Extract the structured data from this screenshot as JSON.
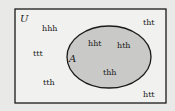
{
  "diagram": {
    "type": "venn",
    "universe_label": "U",
    "set_label": "A",
    "colors": {
      "background": "#e9e9e7",
      "universe_fill": "#f1f1ef",
      "set_fill": "#c9c9c7",
      "stroke": "#1a1a1a"
    },
    "outside_elements": [
      {
        "text": "hhh",
        "x": 40,
        "y": 31
      },
      {
        "text": "ttt",
        "x": 33,
        "y": 56
      },
      {
        "text": "tth",
        "x": 43,
        "y": 85
      },
      {
        "text": "tht",
        "x": 143,
        "y": 24
      },
      {
        "text": "htt",
        "x": 143,
        "y": 97
      }
    ],
    "inside_elements": [
      {
        "text": "hht",
        "x": 88,
        "y": 46
      },
      {
        "text": "hth",
        "x": 117,
        "y": 48
      },
      {
        "text": "thh",
        "x": 102,
        "y": 75
      }
    ]
  }
}
